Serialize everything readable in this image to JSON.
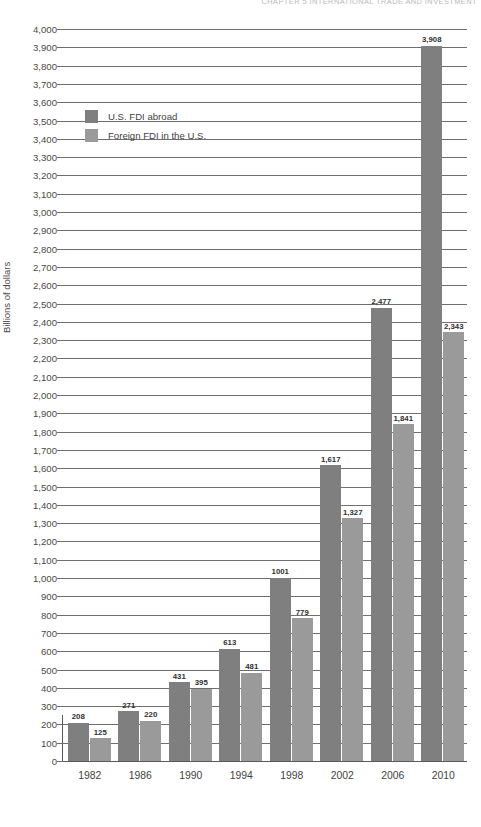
{
  "running_head": "CHAPTER 5   INTERNATIONAL TRADE AND INVESTMENT",
  "legend": {
    "items": [
      {
        "label": "U.S. FDI abroad",
        "color": "#7f7f7f"
      },
      {
        "label": "Foreign FDI in the U.S.",
        "color": "#9a9a9a"
      }
    ]
  },
  "axis": {
    "ylabel": "Billions of dollars",
    "yticks": [
      "4,000",
      "3,900",
      "3,800",
      "3,700",
      "3,600",
      "3,500",
      "3,400",
      "3,300",
      "3,200",
      "3,100",
      "3,000",
      "2,900",
      "2,800",
      "2,700",
      "2,600",
      "2,500",
      "2,400",
      "2,300",
      "2,200",
      "2,100",
      "2,000",
      "1,900",
      "1,800",
      "1,700",
      "1,600",
      "1,500",
      "1,400",
      "1,300",
      "1,200",
      "1,100",
      "1,000",
      "900",
      "800",
      "700",
      "600",
      "500",
      "400",
      "300",
      "200",
      "100",
      "0"
    ]
  },
  "chart_data": {
    "type": "bar",
    "title": "",
    "xlabel": "",
    "ylabel": "Billions of dollars",
    "ylim": [
      0,
      4000
    ],
    "ytick_step": 100,
    "grid": true,
    "legend_position": "upper-left-inside",
    "categories": [
      "1982",
      "1986",
      "1990",
      "1994",
      "1998",
      "2002",
      "2006",
      "2010"
    ],
    "series": [
      {
        "name": "U.S. FDI abroad",
        "color": "#7f7f7f",
        "values": [
          208,
          271,
          431,
          613,
          1001,
          1617,
          2477,
          3908
        ],
        "labels": [
          "208",
          "271",
          "431",
          "613",
          "1001",
          "1,617",
          "2,477",
          "3,908"
        ]
      },
      {
        "name": "Foreign FDI in the U.S.",
        "color": "#9a9a9a",
        "values": [
          125,
          220,
          395,
          481,
          779,
          1327,
          1841,
          2343
        ],
        "labels": [
          "125",
          "220",
          "395",
          "481",
          "779",
          "1,327",
          "1,841",
          "2,343"
        ]
      }
    ]
  }
}
